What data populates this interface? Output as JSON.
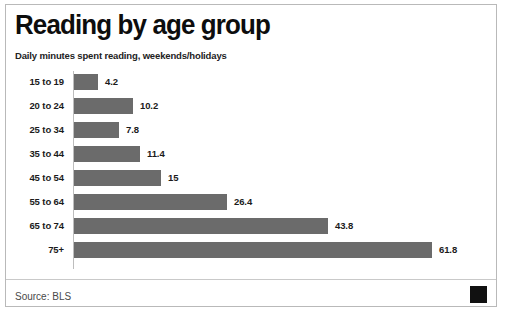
{
  "card": {
    "title": "Reading by age group",
    "subtitle": "Daily minutes spent reading, weekends/holidays",
    "source": "Source: BLS",
    "logo_name": "black-square-logo"
  },
  "colors": {
    "bar": "#6b6b6b",
    "text": "#1b1b1b",
    "title": "#0d0d0d",
    "border": "#b9b9b9",
    "logo": "#111111"
  },
  "chart_data": {
    "type": "bar",
    "orientation": "horizontal",
    "title": "Reading by age group",
    "subtitle": "Daily minutes spent reading, weekends/holidays",
    "xlabel": "",
    "ylabel": "",
    "xlim": [
      0,
      61.8
    ],
    "grid": false,
    "legend": false,
    "value_labels": true,
    "source": "Source: BLS",
    "categories": [
      "15 to 19",
      "20 to 24",
      "25 to 34",
      "35 to 44",
      "45 to 54",
      "55 to 64",
      "65 to 74",
      "75+"
    ],
    "values": [
      4.2,
      10.2,
      7.8,
      11.4,
      15,
      26.4,
      43.8,
      61.8
    ],
    "value_text": [
      "4.2",
      "10.2",
      "7.8",
      "11.4",
      "15",
      "26.4",
      "43.8",
      "61.8"
    ],
    "units": "minutes per day"
  }
}
